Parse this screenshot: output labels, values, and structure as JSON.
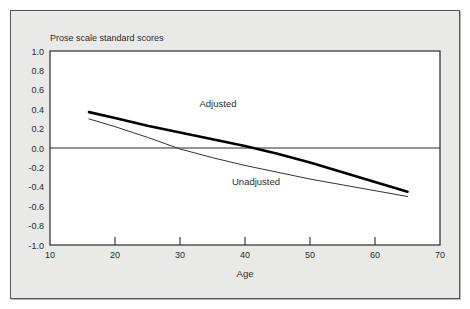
{
  "figure": {
    "background_color": "#e9e9e7",
    "frame_color": "#54545a",
    "page_background": "#ffffff"
  },
  "chart_data": {
    "type": "line",
    "title": "Prose scale standard scores",
    "xlabel": "Age",
    "ylabel": "",
    "xlim": [
      10,
      70
    ],
    "ylim": [
      -1.0,
      1.0
    ],
    "xticks": [
      10,
      20,
      30,
      40,
      50,
      60,
      70
    ],
    "xtick_labels": [
      "10",
      "20",
      "30",
      "40",
      "50",
      "60",
      "70"
    ],
    "yticks": [
      1.0,
      0.8,
      0.6,
      0.4,
      0.2,
      0.0,
      -0.2,
      -0.4,
      -0.6,
      -0.8,
      -1.0
    ],
    "ytick_labels": [
      "1.0",
      "0.8",
      "0.6",
      "0.4",
      "0.2",
      "0.0",
      "-0.2",
      "-0.4",
      "-0.6",
      "-0.8",
      "-1.0"
    ],
    "grid": false,
    "zero_line": true,
    "legend": "inline-annotations",
    "series": [
      {
        "name": "Adjusted",
        "style": "thick-solid",
        "color": "#000000",
        "line_width": 2.6,
        "label_x": 33,
        "label_y": 0.42,
        "x": [
          16,
          20,
          25,
          30,
          35,
          40,
          45,
          50,
          55,
          60,
          65
        ],
        "y": [
          0.37,
          0.31,
          0.23,
          0.16,
          0.09,
          0.02,
          -0.06,
          -0.15,
          -0.25,
          -0.35,
          -0.45
        ]
      },
      {
        "name": "Unadjusted",
        "style": "thin-solid",
        "color": "#1a1a1a",
        "line_width": 0.9,
        "label_x": 38,
        "label_y": -0.38,
        "x": [
          16,
          20,
          25,
          30,
          35,
          40,
          45,
          50,
          55,
          60,
          65
        ],
        "y": [
          0.3,
          0.22,
          0.11,
          -0.01,
          -0.1,
          -0.18,
          -0.25,
          -0.32,
          -0.38,
          -0.44,
          -0.5
        ]
      }
    ],
    "annotations": [
      {
        "text": "Adjusted",
        "x": 33,
        "y": 0.42
      },
      {
        "text": "Unadjusted",
        "x": 38,
        "y": -0.38
      }
    ]
  }
}
